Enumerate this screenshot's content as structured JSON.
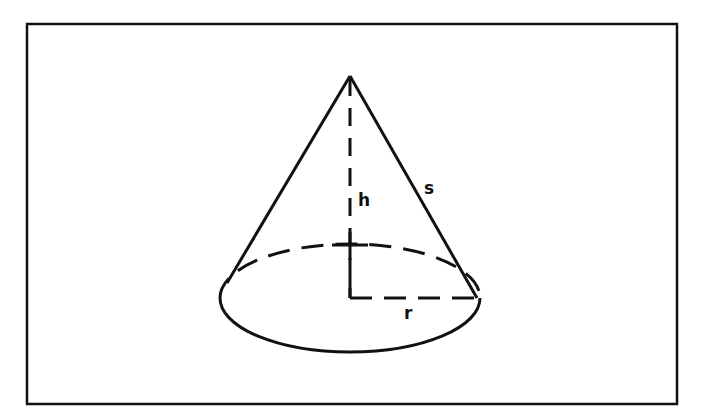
{
  "figure": {
    "labels": {
      "height": "h",
      "slant_height": "s",
      "radius": "r"
    },
    "colors": {
      "stroke": "#111111",
      "background": "#ffffff"
    }
  }
}
